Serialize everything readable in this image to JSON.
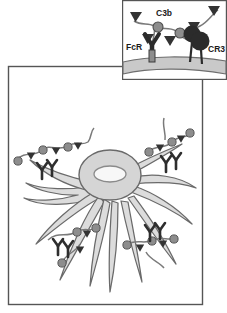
{
  "figure": {
    "background_color": "#ffffff",
    "panels": [
      {
        "id": "main-panel",
        "name": "phagocyte-overview-panel",
        "border_color": "#555555",
        "frame": {
          "x": 8,
          "y": 66,
          "width": 195,
          "height": 239
        }
      },
      {
        "id": "inset-panel",
        "name": "membrane-detail-inset",
        "border_color": "#555555",
        "frame": {
          "x": 122,
          "y": 0,
          "width": 105,
          "height": 80
        }
      }
    ]
  },
  "inset": {
    "labels": [
      {
        "id": "c3b",
        "text": "C3b",
        "x": 34,
        "y": 16
      },
      {
        "id": "fcr",
        "text": "FcR",
        "x": 9,
        "y": 50
      },
      {
        "id": "cr3",
        "text": "CR3",
        "x": 80,
        "y": 52
      }
    ],
    "membrane": {
      "name": "plasma-membrane",
      "fill": "#c9c9c9",
      "stroke": "#6e6e6e"
    },
    "receptors": [
      {
        "id": "fcr-receptor",
        "type": "Y-shaped-receptor",
        "label": "FcR",
        "fill": "#2b2b2b",
        "x": 30,
        "y": 44
      },
      {
        "id": "cr3-receptor",
        "type": "globular-receptor",
        "label": "CR3",
        "fill": "#2b2b2b",
        "x": 70,
        "y": 40
      }
    ],
    "ligands": [
      {
        "id": "c3b-molecule-1",
        "type": "C3b-sphere",
        "fill": "#8d8d8d",
        "x": 36,
        "y": 25
      },
      {
        "id": "c3b-molecule-2",
        "type": "C3b-sphere",
        "fill": "#8d8d8d",
        "x": 58,
        "y": 35
      },
      {
        "id": "antibody-fc-1",
        "type": "antibody-wedge",
        "fill": "#333333"
      },
      {
        "id": "antibody-fc-2",
        "type": "antibody-wedge",
        "fill": "#333333"
      },
      {
        "id": "antibody-fc-3",
        "type": "antibody-wedge",
        "fill": "#333333"
      },
      {
        "id": "antibody-fc-4",
        "type": "antibody-wedge",
        "fill": "#333333"
      }
    ]
  },
  "main": {
    "cell": {
      "name": "phagocyte-cell-body",
      "body_fill": "#d5d5d5",
      "body_stroke": "#6a6a6a",
      "nucleus_fill": "#f7f7f7",
      "nucleus_stroke": "#8a8a8a",
      "pseudopod_fill": "#dcdcdc",
      "pseudopod_stroke": "#6a6a6a",
      "pseudopod_count": 11
    },
    "complexes": [
      {
        "id": "complex-upper-left",
        "name": "immune-complex-upper-left"
      },
      {
        "id": "complex-upper-right",
        "name": "immune-complex-upper-right"
      },
      {
        "id": "complex-lower-left",
        "name": "immune-complex-lower-left"
      },
      {
        "id": "complex-lower-right",
        "name": "immune-complex-lower-right"
      }
    ],
    "colors": {
      "antigen_sphere": "#8d8d8d",
      "antigen_stroke": "#555555",
      "antibody": "#2e2e2e",
      "strand": "#7a7a7a"
    }
  }
}
